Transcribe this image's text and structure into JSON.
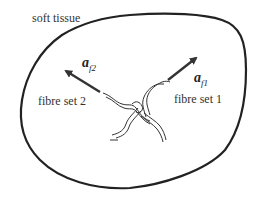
{
  "diagram": {
    "region_label": "soft tissue",
    "fibre_sets": [
      {
        "label": "fibre set 1",
        "vector_symbol": "a",
        "vector_subscript": "f1"
      },
      {
        "label": "fibre set 2",
        "vector_symbol": "a",
        "vector_subscript": "f2"
      }
    ],
    "colors": {
      "outline": "#222222",
      "arrow": "#333333",
      "fibre": "#333333",
      "text": "#333333"
    }
  }
}
